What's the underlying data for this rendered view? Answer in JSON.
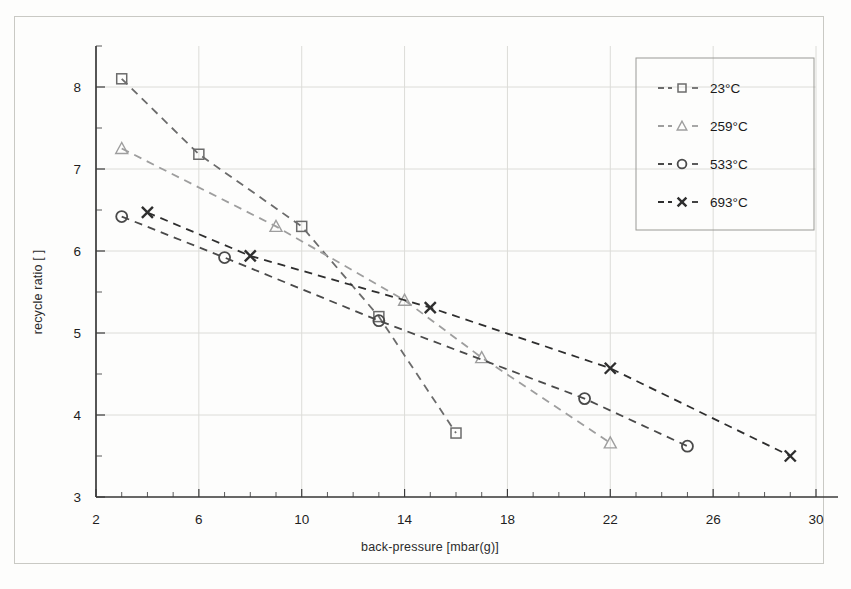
{
  "chart_data": {
    "type": "line",
    "title": "",
    "xlabel": "back-pressure [mbar(g)]",
    "ylabel": "recycle ratio [ ]",
    "xlim": [
      2,
      30
    ],
    "ylim": [
      3,
      8.5
    ],
    "xticks": [
      2,
      6,
      10,
      14,
      18,
      22,
      26,
      30
    ],
    "yticks": [
      3,
      4,
      5,
      6,
      7,
      8
    ],
    "xtick_labels": [
      "2",
      "6",
      "10",
      "14",
      "18",
      "22",
      "26",
      "30"
    ],
    "ytick_labels": [
      "3",
      "4",
      "5",
      "6",
      "7",
      "8"
    ],
    "x_minor_step": 1,
    "y_minor_step": 0.5,
    "grid": true,
    "legend_position": "top-right",
    "series": [
      {
        "name": "23°C",
        "marker": "square",
        "color": "#6b6b6b",
        "linestyle": "dashed",
        "x": [
          3,
          6,
          10,
          13,
          16
        ],
        "y": [
          8.1,
          7.18,
          6.3,
          5.2,
          3.78
        ]
      },
      {
        "name": "259°C",
        "marker": "triangle",
        "color": "#9e9e9e",
        "linestyle": "dashed",
        "x": [
          3,
          9,
          14,
          17,
          22
        ],
        "y": [
          7.25,
          6.3,
          5.4,
          4.7,
          3.66
        ]
      },
      {
        "name": "533°C",
        "marker": "circle",
        "color": "#4a4a4a",
        "linestyle": "dashed",
        "x": [
          3,
          7,
          13,
          21,
          25
        ],
        "y": [
          6.42,
          5.92,
          5.15,
          4.2,
          3.62
        ]
      },
      {
        "name": "693°C",
        "marker": "x",
        "color": "#2e2e2e",
        "linestyle": "dashed",
        "x": [
          4,
          8,
          15,
          22,
          29
        ],
        "y": [
          6.47,
          5.94,
          5.31,
          4.57,
          3.5
        ]
      }
    ]
  },
  "legend": {
    "entries": [
      {
        "label": "23°C",
        "marker": "square"
      },
      {
        "label": "259°C",
        "marker": "triangle"
      },
      {
        "label": "533°C",
        "marker": "circle"
      },
      {
        "label": "693°C",
        "marker": "x"
      }
    ]
  },
  "axes": {
    "x_title": "back-pressure [mbar(g)]",
    "y_title": "recycle ratio [ ]"
  }
}
